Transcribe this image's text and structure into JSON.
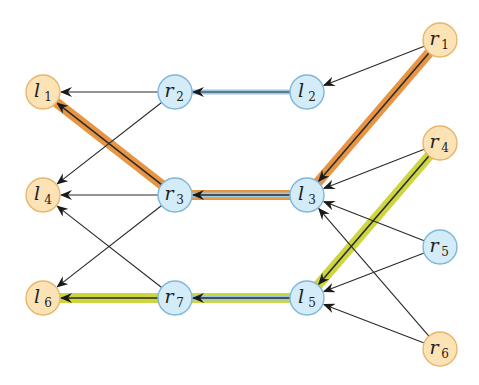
{
  "diagram": {
    "colors": {
      "free_node_fill": "#fbe3b6",
      "free_node_stroke": "#e8b66a",
      "matched_node_fill": "#d4ebf8",
      "matched_node_stroke": "#7fb6da",
      "edge": "#2a2a2a",
      "matching_highlight": "#9cc8e8",
      "path_orange": "#e58a2e",
      "path_yellow": "#c8d12b"
    },
    "nodes": [
      {
        "id": "l1",
        "letter": "l",
        "sub": "1",
        "type": "free"
      },
      {
        "id": "l4",
        "letter": "l",
        "sub": "4",
        "type": "free"
      },
      {
        "id": "l6",
        "letter": "l",
        "sub": "6",
        "type": "free"
      },
      {
        "id": "r2",
        "letter": "r",
        "sub": "2",
        "type": "matched"
      },
      {
        "id": "r3",
        "letter": "r",
        "sub": "3",
        "type": "matched"
      },
      {
        "id": "r7",
        "letter": "r",
        "sub": "7",
        "type": "matched"
      },
      {
        "id": "l2",
        "letter": "l",
        "sub": "2",
        "type": "matched"
      },
      {
        "id": "l3",
        "letter": "l",
        "sub": "3",
        "type": "matched"
      },
      {
        "id": "l5",
        "letter": "l",
        "sub": "5",
        "type": "matched"
      },
      {
        "id": "r1",
        "letter": "r",
        "sub": "1",
        "type": "free"
      },
      {
        "id": "r4",
        "letter": "r",
        "sub": "4",
        "type": "free"
      },
      {
        "id": "r5",
        "letter": "r",
        "sub": "5",
        "type": "matched"
      },
      {
        "id": "r6",
        "letter": "r",
        "sub": "6",
        "type": "free"
      }
    ],
    "edges": [
      {
        "from": "r2",
        "to": "l1"
      },
      {
        "from": "r2",
        "to": "l4"
      },
      {
        "from": "l2",
        "to": "r2",
        "matching": true
      },
      {
        "from": "r1",
        "to": "l2"
      },
      {
        "from": "r3",
        "to": "l1",
        "path": "orange"
      },
      {
        "from": "r3",
        "to": "l4"
      },
      {
        "from": "r3",
        "to": "l6"
      },
      {
        "from": "l3",
        "to": "r3",
        "matching": true,
        "path": "orange"
      },
      {
        "from": "r1",
        "to": "l3",
        "path": "orange"
      },
      {
        "from": "r4",
        "to": "l3"
      },
      {
        "from": "r5",
        "to": "l3"
      },
      {
        "from": "r6",
        "to": "l3"
      },
      {
        "from": "r7",
        "to": "l4"
      },
      {
        "from": "r7",
        "to": "l6",
        "path": "yellow"
      },
      {
        "from": "l5",
        "to": "r7",
        "matching": true,
        "path": "yellow"
      },
      {
        "from": "r4",
        "to": "l5",
        "path": "yellow"
      },
      {
        "from": "r5",
        "to": "l5"
      },
      {
        "from": "r6",
        "to": "l5"
      }
    ],
    "paths": [
      {
        "name": "orange",
        "sequence": [
          "r1",
          "l3",
          "r3",
          "l1"
        ]
      },
      {
        "name": "yellow",
        "sequence": [
          "r4",
          "l5",
          "r7",
          "l6"
        ]
      }
    ]
  }
}
